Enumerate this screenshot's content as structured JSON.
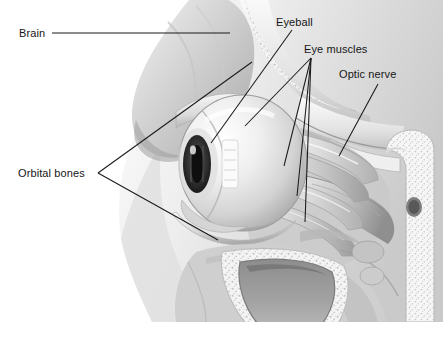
{
  "figure": {
    "style": "grayscale medical illustration",
    "width": 443,
    "height": 339,
    "background_color": "#ffffff",
    "leader_line_color": "#1a1a1a",
    "label_text_color": "#161616"
  },
  "labels": [
    {
      "id": "brain",
      "text": "Brain",
      "x": 19,
      "y": 27,
      "leader": "horizontal line running right from the label to the brain mass"
    },
    {
      "id": "eyeball",
      "text": "Eyeball",
      "x": 276,
      "y": 16,
      "leader": "single line descending left to the globe of the eye"
    },
    {
      "id": "eye_muscles",
      "text": "Eye muscles",
      "x": 304,
      "y": 43,
      "leader": "fan of four lines descending to the extraocular muscle bands"
    },
    {
      "id": "optic_nerve",
      "text": "Optic nerve",
      "x": 339,
      "y": 68,
      "leader": "single line descending left to the optic nerve"
    },
    {
      "id": "orbital_bones",
      "text": "Orbital bones",
      "x": 18,
      "y": 167,
      "leader": "two lines forming a fork to the upper and lower orbital bone"
    }
  ],
  "structures": [
    {
      "id": "brain",
      "name": "Brain",
      "tone": "#b9b9b9"
    },
    {
      "id": "eyeball",
      "name": "Eyeball",
      "tone": "#e8e8e8"
    },
    {
      "id": "iris",
      "name": "Iris and pupil",
      "tone": "#2c2c2c"
    },
    {
      "id": "cornea_highlight",
      "name": "Corneal highlight",
      "tone": "#fafafa"
    },
    {
      "id": "eye_muscles",
      "name": "Extraocular muscles",
      "tone": "#cfcfcf"
    },
    {
      "id": "optic_nerve",
      "name": "Optic nerve",
      "tone": "#c2c2c2"
    },
    {
      "id": "orbital_bones",
      "name": "Orbital bones",
      "tone": "#eeeeee"
    },
    {
      "id": "maxillary_sinus",
      "name": "Maxillary sinus cavity",
      "tone": "#9b9b9b"
    },
    {
      "id": "trabecular_bone",
      "name": "Trabecular bone",
      "tone": "#f2f2f2"
    }
  ]
}
